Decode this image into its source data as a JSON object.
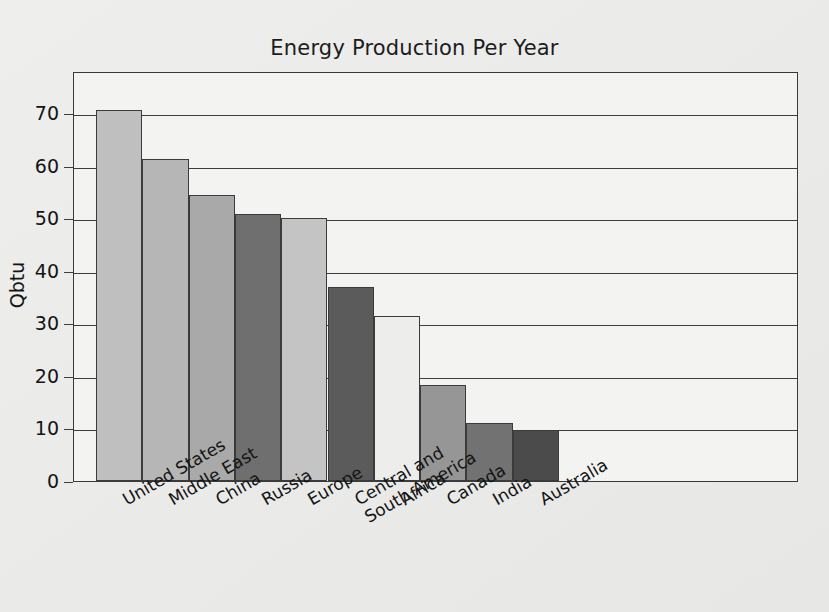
{
  "chart_data": {
    "type": "bar",
    "title": "Energy Production Per Year",
    "xlabel": "",
    "ylabel": "Qbtu",
    "ylim": [
      0,
      78
    ],
    "yticks": [
      0,
      10,
      20,
      30,
      40,
      50,
      60,
      70
    ],
    "ytick_labels": [
      "0",
      "10",
      "20",
      "30",
      "40",
      "50",
      "60",
      "70"
    ],
    "grid": "horizontal",
    "legend": "none",
    "categories": [
      "United States",
      "Middle East",
      "China",
      "Russia",
      "Europe",
      "Central and South America",
      "Africa",
      "Canada",
      "India",
      "Australia"
    ],
    "category_lines": [
      [
        "United States"
      ],
      [
        "Middle East"
      ],
      [
        "China"
      ],
      [
        "Russia"
      ],
      [
        "Europe"
      ],
      [
        "Central and",
        "South America"
      ],
      [
        "Africa"
      ],
      [
        "Canada"
      ],
      [
        "India"
      ],
      [
        "Australia"
      ]
    ],
    "values": [
      70.5,
      61.3,
      54.5,
      50.8,
      50.0,
      37.0,
      31.3,
      18.2,
      11.1,
      9.7
    ],
    "bar_colors": [
      "#bfbfbf",
      "#b6b6b6",
      "#a9a9a9",
      "#6f6f6f",
      "#c4c4c4",
      "#5b5b5b",
      "#ededec",
      "#969696",
      "#727272",
      "#4b4b4b"
    ],
    "bar_edge_color": "#3b3b3b",
    "axis_color": "#3d3d3d",
    "plot_background": "#f3f3f2",
    "figure_background": "#ececeb",
    "text_color": "#141414"
  }
}
